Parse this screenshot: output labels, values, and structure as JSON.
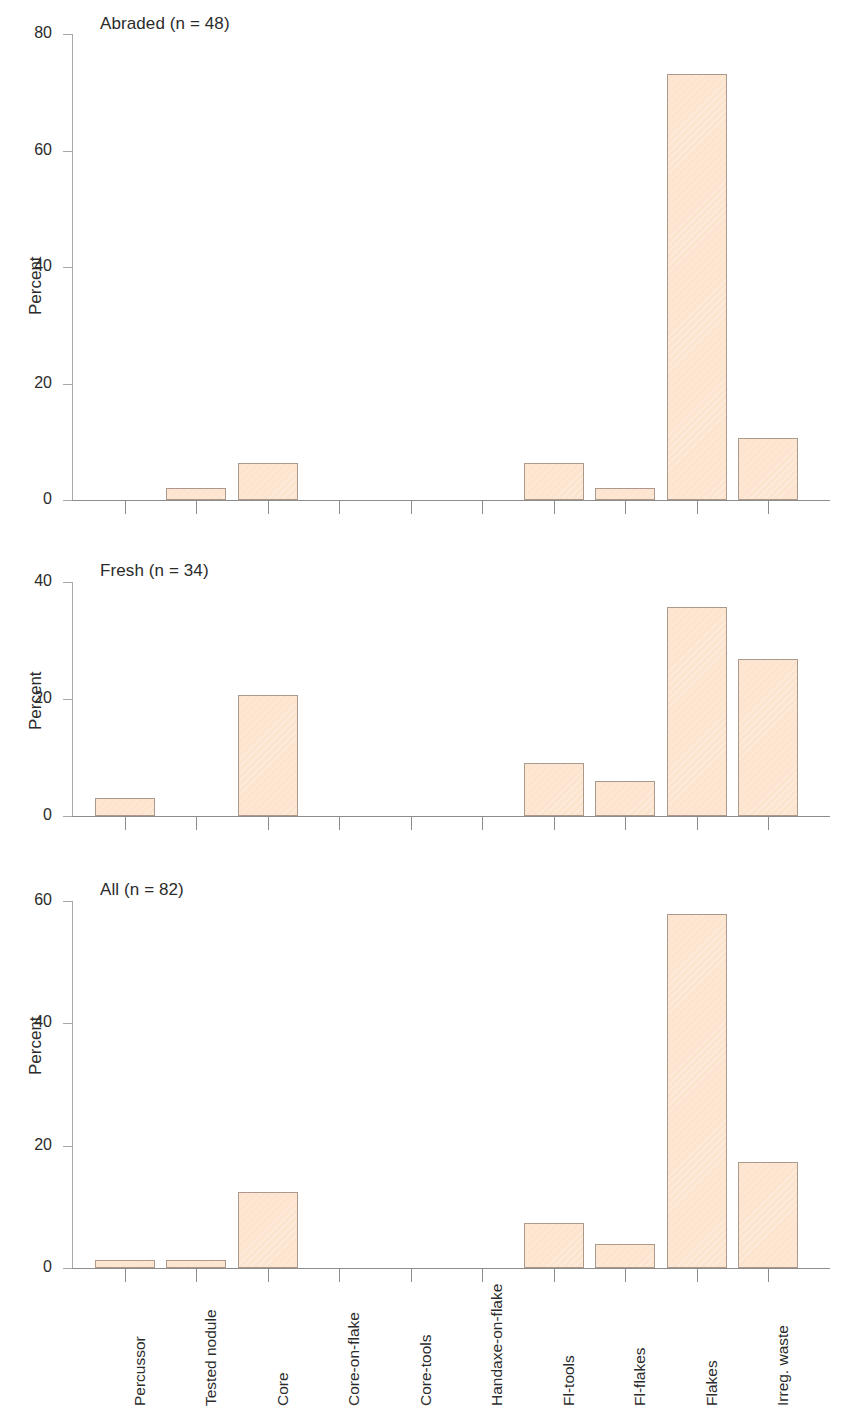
{
  "figure": {
    "background": "#ffffff",
    "bar_fill": "#fce4cf",
    "bar_border": "#ab9a8b",
    "axis_color": "#8c8c8c"
  },
  "axis_titles": {
    "y": "Percent"
  },
  "categories": [
    "Percussor",
    "Tested nodule",
    "Core",
    "Core-on-flake",
    "Core-tools",
    "Handaxe-on-flake",
    "Fl-tools",
    "Fl-flakes",
    "Flakes",
    "Irreg. waste"
  ],
  "panels": [
    {
      "title": "Abraded (n = 48)",
      "ylabel": "Percent",
      "ylim": [
        0,
        80
      ],
      "yticks": [
        0,
        20,
        40,
        60,
        80
      ],
      "values": [
        0,
        2.1,
        6.3,
        0,
        0,
        0,
        6.3,
        2.1,
        73.1,
        10.6
      ]
    },
    {
      "title": "Fresh (n = 34)",
      "ylabel": "Percent",
      "ylim": [
        0,
        40
      ],
      "yticks": [
        0,
        20,
        40
      ],
      "values": [
        3.0,
        0,
        20.7,
        0,
        0,
        0,
        9.0,
        6.0,
        35.8,
        26.8
      ]
    },
    {
      "title": "All (n = 82)",
      "ylabel": "Percent",
      "ylim": [
        0,
        60
      ],
      "yticks": [
        0,
        20,
        40,
        60
      ],
      "values": [
        1.3,
        1.3,
        12.4,
        0,
        0,
        0,
        7.4,
        4.0,
        57.8,
        17.3
      ]
    }
  ],
  "chart_data": {
    "type": "bar",
    "title": "",
    "xlabel": "",
    "ylabel": "Percent",
    "grid": false,
    "legend": "none",
    "orientation": "vertical",
    "panel_layout": "3 stacked subplots, shared x categories",
    "categories": [
      "Percussor",
      "Tested nodule",
      "Core",
      "Core-on-flake",
      "Core-tools",
      "Handaxe-on-flake",
      "Fl-tools",
      "Fl-flakes",
      "Flakes",
      "Irreg. waste"
    ],
    "series": [
      {
        "name": "Abraded (n = 48)",
        "ylim": [
          0,
          80
        ],
        "yticks": [
          0,
          20,
          40,
          60,
          80
        ],
        "values": [
          0,
          2.1,
          6.3,
          0,
          0,
          0,
          6.3,
          2.1,
          73.1,
          10.6
        ]
      },
      {
        "name": "Fresh (n = 34)",
        "ylim": [
          0,
          40
        ],
        "yticks": [
          0,
          20,
          40
        ],
        "values": [
          3.0,
          0,
          20.7,
          0,
          0,
          0,
          9.0,
          6.0,
          35.8,
          26.8
        ]
      },
      {
        "name": "All (n = 82)",
        "ylim": [
          0,
          60
        ],
        "yticks": [
          0,
          20,
          40,
          60
        ],
        "values": [
          1.3,
          1.3,
          12.4,
          0,
          0,
          0,
          7.4,
          4.0,
          57.8,
          17.3
        ]
      }
    ]
  }
}
